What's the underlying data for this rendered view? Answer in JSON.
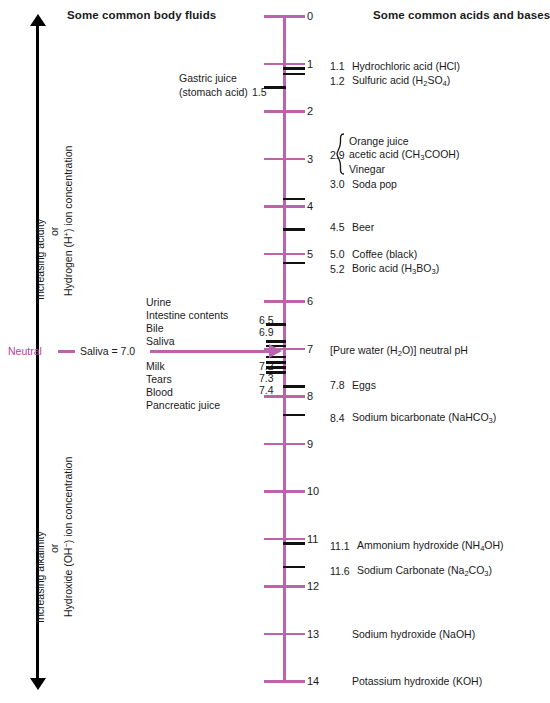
{
  "headers": {
    "left": "Some common body fluids",
    "right": "Some common acids and bases"
  },
  "left_axis": {
    "top_arrow_icon": "arrow-up",
    "bottom_arrow_icon": "arrow-down",
    "acid_line1": "Increasing acidity",
    "acid_or": "or",
    "acid_line2": "Hydrogen (H+) ion concentration",
    "alk_line1": "Increasing alkalinity",
    "alk_or": "or",
    "alk_line2": "Hydroxide (OH−) ion concentration"
  },
  "neutral_row": {
    "word": "Neutral",
    "label": "Saliva = 7.0",
    "arrow_icon": "arrow-right"
  },
  "scale": {
    "ph_min": 0,
    "ph_max": 14,
    "tick_labels": [
      "0",
      "1",
      "2",
      "3",
      "4",
      "5",
      "6",
      "7",
      "8",
      "9",
      "10",
      "11",
      "12",
      "13",
      "14"
    ],
    "accent_color": "#bd63ac",
    "neutral_color": "#b8409f",
    "black_color": "#111111"
  },
  "chart_data": {
    "type": "scale",
    "axis": {
      "label": "pH",
      "min": 0,
      "max": 14,
      "orientation": "vertical",
      "direction": "top-is-acidic"
    },
    "left_series_name": "Some common body fluids",
    "right_series_name": "Some common acids and bases",
    "left_items": [
      {
        "ph": 1.5,
        "label": "Gastric juice\n(stomach acid)",
        "show_value": true
      },
      {
        "ph": 6.5,
        "label": "Urine",
        "show_value": true
      },
      {
        "ph": 6.9,
        "label": "Intestine contents",
        "show_value": true
      },
      {
        "ph": 7.0,
        "label": "Bile",
        "show_value": false
      },
      {
        "ph": 7.0,
        "label": "Saliva",
        "show_value": false
      },
      {
        "ph": 7.2,
        "label": "Milk",
        "show_value": true
      },
      {
        "ph": 7.3,
        "label": "Tears",
        "show_value": true
      },
      {
        "ph": 7.4,
        "label": "Blood",
        "show_value": true
      },
      {
        "ph": 7.6,
        "label": "Pancreatic juice",
        "show_value": false
      }
    ],
    "right_items": [
      {
        "ph": 1.1,
        "value": "1.1",
        "label": "Hydrochloric acid (HCl)"
      },
      {
        "ph": 1.2,
        "value": "1.2",
        "label": "Sulfuric acid (H2SO4)"
      },
      {
        "ph": 2.9,
        "value": "2.9",
        "label": "Orange juice / acetic acid (CH3COOH) / Vinegar"
      },
      {
        "ph": 3.0,
        "value": "3.0",
        "label": "Soda pop"
      },
      {
        "ph": 4.5,
        "value": "4.5",
        "label": "Beer"
      },
      {
        "ph": 5.0,
        "value": "5.0",
        "label": "Coffee (black)"
      },
      {
        "ph": 5.2,
        "value": "5.2",
        "label": "Boric acid (H3BO3)"
      },
      {
        "ph": 7.0,
        "value": "7",
        "label": "[Pure water (H2O)] neutral pH"
      },
      {
        "ph": 7.8,
        "value": "7.8",
        "label": "Eggs"
      },
      {
        "ph": 8.4,
        "value": "8.4",
        "label": "Sodium bicarbonate (NaHCO3)"
      },
      {
        "ph": 11.1,
        "value": "11.1",
        "label": "Ammonium hydroxide (NH4OH)"
      },
      {
        "ph": 11.6,
        "value": "11.6",
        "label": "Sodium Carbonate (Na2CO3)"
      },
      {
        "ph": 13.0,
        "value": "",
        "label": "Sodium hydroxide (NaOH)"
      },
      {
        "ph": 14.0,
        "value": "",
        "label": "Potassium hydroxide (KOH)"
      }
    ]
  },
  "left_labels": {
    "gastric_1": "Gastric juice",
    "gastric_2": "(stomach acid)",
    "gastric_val": "1.5",
    "urine": "Urine",
    "intestine": "Intestine contents",
    "bile": "Bile",
    "saliva": "Saliva",
    "milk": "Milk",
    "tears": "Tears",
    "blood": "Blood",
    "pancreatic": "Pancreatic juice",
    "v65": "6.5",
    "v69": "6.9",
    "v72": "7.2",
    "v73": "7.3",
    "v74": "7.4"
  },
  "right_labels": {
    "v11": "1.1",
    "n11": "Hydrochloric acid (HCl)",
    "v12": "1.2",
    "n12a": "Sulfuric acid (H",
    "n12b": "2",
    "n12c": "SO",
    "n12d": "4",
    "n12e": ")",
    "v29": "2.9",
    "g1": "Orange juice",
    "g2a": "acetic acid (CH",
    "g2b": "3",
    "g2c": "COOH)",
    "g3": "Vinegar",
    "v30": "3.0",
    "n30": "Soda pop",
    "v45": "4.5",
    "n45": "Beer",
    "v50": "5.0",
    "n50": "Coffee (black)",
    "v52": "5.2",
    "n52a": "Boric acid (H",
    "n52b": "3",
    "n52c": "BO",
    "n52d": "3",
    "n52e": ")",
    "v70": "7",
    "n70a": "[Pure water (H",
    "n70b": "2",
    "n70c": "O)] neutral pH",
    "v78": "7.8",
    "n78": "Eggs",
    "v84": "8.4",
    "n84a": "Sodium bicarbonate (NaHCO",
    "n84b": "3",
    "n84c": ")",
    "v111": "11.1",
    "n111a": "Ammonium hydroxide (NH",
    "n111b": "4",
    "n111c": "OH)",
    "v116": "11.6",
    "n116a": "Sodium Carbonate (Na",
    "n116b": "2",
    "n116c": "CO",
    "n116d": "3",
    "n116e": ")",
    "n130": "Sodium hydroxide (NaOH)",
    "n140": "Potassium hydroxide (KOH)"
  }
}
